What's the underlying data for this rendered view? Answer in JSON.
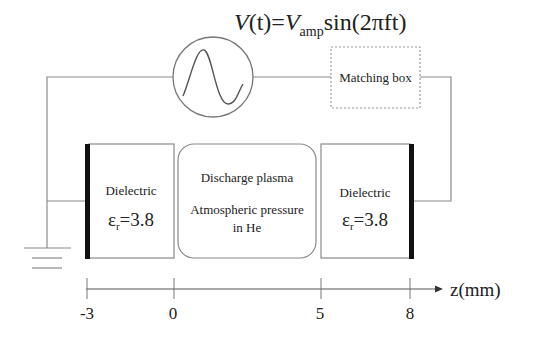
{
  "equation": {
    "lhs": "V",
    "lhs_arg": "(t)",
    "equals": "=",
    "amp_symbol": "V",
    "amp_subscript": "amp",
    "rhs": "sin(2πft)"
  },
  "source": {
    "icon": "ac-voltage-source-icon"
  },
  "matching_box": {
    "label": "Matching box"
  },
  "left_dielectric": {
    "title": "Dielectric",
    "epsilon_symbol": "ε",
    "epsilon_subscript": "r",
    "epsilon_value": "=3.8"
  },
  "plasma": {
    "title": "Discharge plasma",
    "line1": "Atmospheric pressure",
    "line2": "in He"
  },
  "right_dielectric": {
    "title": "Dielectric",
    "epsilon_symbol": "ε",
    "epsilon_subscript": "r",
    "epsilon_value": "=3.8"
  },
  "ground": {
    "icon": "ground-icon"
  },
  "axis": {
    "label": "z(mm)",
    "ticks": [
      "-3",
      "0",
      "5",
      "8"
    ]
  },
  "colors": {
    "electrode": "#111111",
    "wire": "#8a8a8a",
    "text": "#222222"
  }
}
